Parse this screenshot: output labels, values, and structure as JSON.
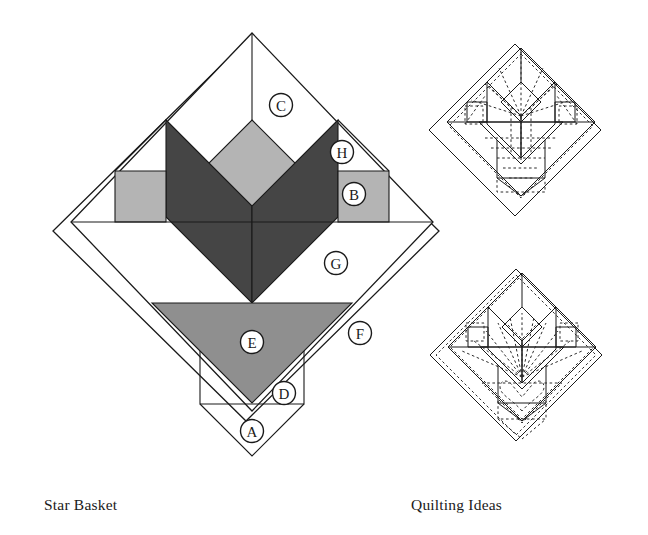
{
  "page": {
    "background": "#ffffff"
  },
  "captions": {
    "left": "Star Basket",
    "right": "Quilting Ideas"
  },
  "colors": {
    "outline": "#1a1a1a",
    "dark_fabric": "#454545",
    "medium_fabric": "#8f8f8f",
    "light_fabric": "#b4b4b4",
    "background_fabric": "#ffffff",
    "quilting_dash": "#2b2b2b"
  },
  "main_block": {
    "name": "Star Basket",
    "center": {
      "x": 252,
      "y": 222
    },
    "half_width": 181,
    "piece_labels": [
      {
        "id": "A",
        "label": "A",
        "x": 252,
        "y": 431,
        "desc": "bottom corner triangle"
      },
      {
        "id": "B",
        "label": "B",
        "x": 354,
        "y": 194,
        "desc": "light square side unit"
      },
      {
        "id": "C",
        "label": "C",
        "x": 281,
        "y": 105,
        "desc": "upper background triangle"
      },
      {
        "id": "D",
        "label": "D",
        "x": 284,
        "y": 393,
        "desc": "small basket foot triangle"
      },
      {
        "id": "E",
        "label": "E",
        "x": 252,
        "y": 342,
        "desc": "basket body triangle"
      },
      {
        "id": "F",
        "label": "F",
        "x": 360,
        "y": 333,
        "desc": "outer border strip"
      },
      {
        "id": "G",
        "label": "G",
        "x": 336,
        "y": 263,
        "desc": "large background triangle"
      },
      {
        "id": "H",
        "label": "H",
        "x": 342,
        "y": 152,
        "desc": "small background triangle"
      }
    ]
  },
  "quilting_diagrams": [
    {
      "id": "quilting-top",
      "center": {
        "x": 515,
        "y": 130
      },
      "half_width": 88,
      "motifs": [
        "echo outline quilting",
        "radiating petal lines",
        "horizontal basket fill"
      ]
    },
    {
      "id": "quilting-bottom",
      "center": {
        "x": 516,
        "y": 355
      },
      "half_width": 93,
      "motifs": [
        "fan / radiating spray",
        "heart motif in basket",
        "echo border quilting"
      ]
    }
  ]
}
